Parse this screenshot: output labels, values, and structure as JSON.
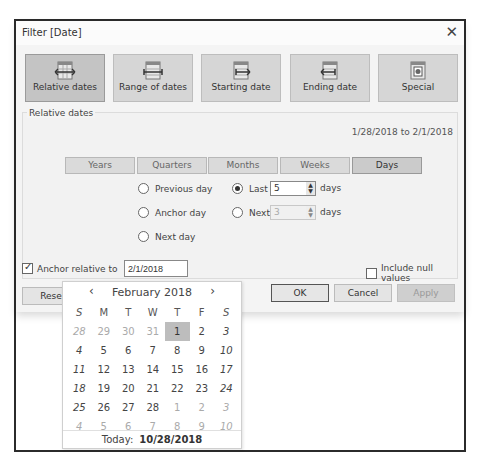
{
  "dialog": {
    "title": "Filter [Date]",
    "close_glyph": "✕"
  },
  "modes": [
    {
      "label": "Relative dates",
      "icon": "calendar-both-arrows-icon",
      "active": true
    },
    {
      "label": "Range of dates",
      "icon": "calendar-range-icon",
      "active": false
    },
    {
      "label": "Starting date",
      "icon": "calendar-right-arrow-icon",
      "active": false
    },
    {
      "label": "Ending date",
      "icon": "calendar-left-arrow-icon",
      "active": false
    },
    {
      "label": "Special",
      "icon": "calendar-special-icon",
      "active": false
    }
  ],
  "relative": {
    "group_label": "Relative dates",
    "range_text": "1/28/2018 to 2/1/2018",
    "tabs": [
      {
        "label": "Years",
        "active": false
      },
      {
        "label": "Quarters",
        "active": false
      },
      {
        "label": "Months",
        "active": false
      },
      {
        "label": "Weeks",
        "active": false
      },
      {
        "label": "Days",
        "active": true
      }
    ],
    "options": {
      "previous": "Previous day",
      "anchor": "Anchor day",
      "next_day": "Next day",
      "last": "Last",
      "next": "Next",
      "last_value": "5",
      "next_value": "3",
      "unit": "days",
      "selected": "last"
    }
  },
  "anchor": {
    "label": "Anchor relative to",
    "checked": true,
    "value": "2/1/2018"
  },
  "include_null": {
    "label": "Include null values",
    "checked": false
  },
  "buttons": {
    "reset": "Rese",
    "ok": "OK",
    "cancel": "Cancel",
    "apply": "Apply"
  },
  "calendar": {
    "prev_glyph": "‹",
    "next_glyph": "›",
    "month_label": "February  2018",
    "dow": [
      "S",
      "M",
      "T",
      "W",
      "T",
      "F",
      "S"
    ],
    "weeks": [
      [
        "28",
        "29",
        "30",
        "31",
        "1",
        "2",
        "3"
      ],
      [
        "4",
        "5",
        "6",
        "7",
        "8",
        "9",
        "10"
      ],
      [
        "11",
        "12",
        "13",
        "14",
        "15",
        "16",
        "17"
      ],
      [
        "18",
        "19",
        "20",
        "21",
        "22",
        "23",
        "24"
      ],
      [
        "25",
        "26",
        "27",
        "28",
        "1",
        "2",
        "3"
      ],
      [
        "4",
        "5",
        "6",
        "7",
        "8",
        "9",
        "10"
      ]
    ],
    "selected_day": "1",
    "today_label": "Today:",
    "today_value": "10/28/2018"
  }
}
